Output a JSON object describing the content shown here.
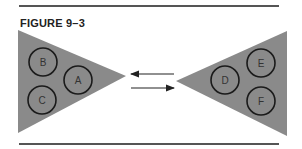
{
  "figure": {
    "title": "FIGURE 9–3",
    "colors": {
      "triangle": "#8a8a8a",
      "circle_stroke": "#1a1a1a",
      "arrow": "#222222",
      "rule": "#555555"
    },
    "left_group": {
      "circles": [
        "B",
        "A",
        "C"
      ]
    },
    "right_group": {
      "circles": [
        "D",
        "E",
        "F"
      ]
    },
    "arrows": [
      {
        "direction": "left"
      },
      {
        "direction": "right"
      }
    ]
  }
}
